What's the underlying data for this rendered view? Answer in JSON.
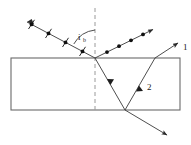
{
  "figure": {
    "labels": {
      "angle_symbol": "i",
      "angle_subscript": "b",
      "ray_one": "1",
      "ray_two": "2"
    },
    "colors": {
      "line": "#4a4a4a",
      "ray": "#3a3a3a",
      "marker": "#111111",
      "dash": "#8a8a8a",
      "background": "#ffffff",
      "text": "#1a1a1a"
    },
    "slab": {
      "name": "glass-slab",
      "x": 11,
      "y": 58,
      "width": 169,
      "height": 52
    },
    "normal_line": {
      "name": "normal-dashed-line",
      "x": 95,
      "y1": 8,
      "y2": 111,
      "dash_pattern": "4,3"
    },
    "incidence_point": {
      "x": 95,
      "y": 58
    },
    "bottom_vertex": {
      "x": 125,
      "y": 110
    },
    "exit_point": {
      "x": 155,
      "y": 58
    },
    "rays": {
      "incident": {
        "name": "incident-ray",
        "from": {
          "x": 27,
          "y": 22
        },
        "to": {
          "x": 95,
          "y": 58
        },
        "polarization": "unpolarized",
        "markers": "dots-and-ticks",
        "dot_count": 4,
        "tick_count": 4,
        "arrow": "at-source-end"
      },
      "reflected": {
        "name": "reflected-ray",
        "from": {
          "x": 95,
          "y": 58
        },
        "to": {
          "x": 156,
          "y": 28
        },
        "polarization": "perpendicular",
        "markers": "dots-only",
        "dot_count": 4,
        "arrow": "at-far-end"
      },
      "refracted_internal": {
        "name": "refracted-ray-internal",
        "from": {
          "x": 95,
          "y": 58
        },
        "to": {
          "x": 125,
          "y": 110
        },
        "arrow": "midpoint"
      },
      "internal_reflected": {
        "name": "internally-reflected-ray",
        "from": {
          "x": 125,
          "y": 110
        },
        "to": {
          "x": 155,
          "y": 58
        },
        "arrow": "midpoint",
        "label": "2"
      },
      "exit_top": {
        "name": "exit-ray-top",
        "from": {
          "x": 155,
          "y": 58
        },
        "to": {
          "x": 181,
          "y": 41
        },
        "arrow": "at-far-end",
        "label": "1"
      },
      "transmitted_bottom": {
        "name": "transmitted-ray-bottom",
        "from": {
          "x": 125,
          "y": 110
        },
        "to": {
          "x": 170,
          "y": 137
        },
        "arrow": "at-far-end"
      }
    },
    "angle_arc": {
      "name": "angle-of-incidence-arc",
      "center": {
        "x": 95,
        "y": 58
      },
      "radius": 28,
      "label_x": 80,
      "label_y": 36
    }
  }
}
